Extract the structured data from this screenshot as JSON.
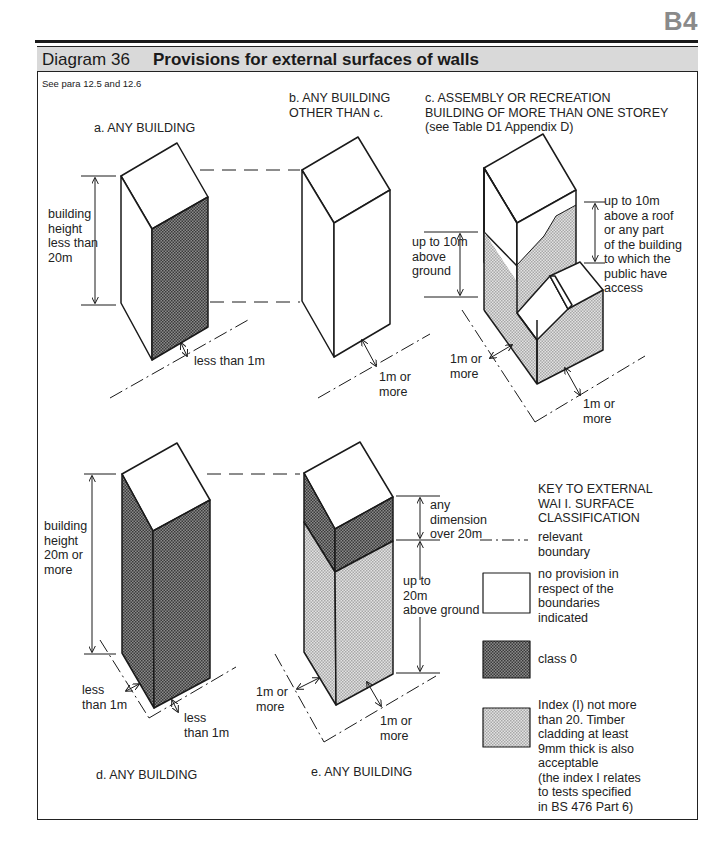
{
  "page": {
    "section_code": "B4"
  },
  "diagram": {
    "number_label": "Diagram 36",
    "title": "Provisions for external surfaces of walls",
    "reference": "See para 12.5 and 12.6"
  },
  "panels": {
    "a": {
      "caption": "a. ANY BUILDING",
      "height_label": [
        "building",
        "height",
        "less than",
        "20m"
      ],
      "boundary_label": "less than 1m"
    },
    "b": {
      "caption": [
        "b. ANY BUILDING",
        "OTHER THAN c."
      ],
      "boundary_label": [
        "1m or",
        "more"
      ]
    },
    "c": {
      "caption": [
        "c. ASSEMBLY OR RECREATION",
        "BUILDING OF MORE THAN ONE STOREY",
        "(see Table D1 Appendix D)"
      ],
      "ground_label": [
        "up to 10m",
        "above",
        "ground"
      ],
      "roof_label": [
        "up to 10m",
        "above a roof",
        "or any part",
        "of the building",
        "to which the",
        "public have",
        "access"
      ],
      "boundary_left_label": [
        "1m or",
        "more"
      ],
      "boundary_right_label": [
        "1m or",
        "more"
      ]
    },
    "d": {
      "caption": "d. ANY BUILDING",
      "height_label": [
        "building",
        "height",
        "20m or",
        "more"
      ],
      "boundary_left_label": [
        "less",
        "than 1m"
      ],
      "boundary_right_label": [
        "less",
        "than 1m"
      ]
    },
    "e": {
      "caption": "e. ANY BUILDING",
      "upper_label": [
        "any",
        "dimension",
        "over 20m"
      ],
      "lower_label": [
        "up to",
        "20m",
        "above ground"
      ],
      "boundary_left_label": [
        "1m or",
        "more"
      ],
      "boundary_right_label": [
        "1m or",
        "more"
      ]
    }
  },
  "key": {
    "title": [
      "KEY TO EXTERNAL",
      "WAI I. SURFACE",
      "CLASSIFICATION"
    ],
    "items": [
      {
        "symbol": "dash-dot-line",
        "label": [
          "relevant",
          "boundary"
        ]
      },
      {
        "symbol": "white-box",
        "color": "#ffffff",
        "label": [
          "no provision in",
          "respect of the",
          "boundaries",
          "indicated"
        ]
      },
      {
        "symbol": "dark-hatch-box",
        "color": "#6e6e6e",
        "label": [
          "class 0"
        ]
      },
      {
        "symbol": "light-hatch-box",
        "color": "#c4c4c4",
        "label": [
          "Index (I) not more",
          "than 20. Timber",
          "cladding at least",
          "9mm thick is also",
          "acceptable",
          "(the index I relates",
          "to tests specified",
          "in BS 476 Part 6)"
        ]
      }
    ]
  },
  "colors": {
    "class0_fill": "#6e6e6e",
    "index20_fill": "#c4c4c4",
    "title_bar": "#d9d9d9",
    "line": "#1a1a1a"
  }
}
